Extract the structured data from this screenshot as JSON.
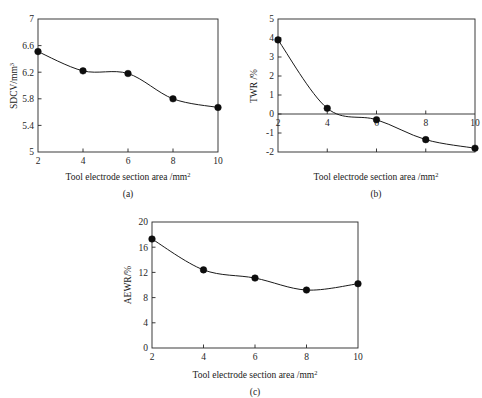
{
  "figure": {
    "xlabel": "Tool electrode section area /mm",
    "xlabel_sup": "2",
    "captions": {
      "a": "(a)",
      "b": "(b)",
      "c": "(c)"
    }
  },
  "chart_data": [
    {
      "type": "line",
      "panel": "(a)",
      "title": "",
      "xlabel": "Tool electrode section area /mm2",
      "ylabel": "SDCV/mm3",
      "ylabel_base": "SDCV/mm",
      "ylabel_sup": "3",
      "x": [
        2,
        4,
        6,
        8,
        10
      ],
      "values": [
        6.51,
        6.22,
        6.18,
        5.8,
        5.67
      ],
      "xlim": [
        2,
        10
      ],
      "ylim": [
        5,
        7
      ],
      "xticks": [
        2,
        4,
        6,
        8,
        10
      ],
      "xticklabels": [
        "2",
        "4",
        "6",
        "8",
        "10"
      ],
      "yticks": [
        5,
        5.4,
        5.8,
        6.2,
        6.6,
        7
      ],
      "yticklabels": [
        "5",
        "5.4",
        "5.8",
        "6.2",
        "6.6",
        "7"
      ],
      "grid": false,
      "legend": "none",
      "marker": "filled-circle",
      "line_style": "smooth"
    },
    {
      "type": "line",
      "panel": "(b)",
      "title": "",
      "xlabel": "Tool electrode section area /mm2",
      "ylabel": "TWR /%",
      "ylabel_base": "TWR /%",
      "ylabel_sup": "",
      "x": [
        2,
        4,
        6,
        8,
        10
      ],
      "values": [
        3.9,
        0.3,
        -0.3,
        -1.35,
        -1.8
      ],
      "xlim": [
        2,
        10
      ],
      "ylim": [
        -2,
        5
      ],
      "xticks": [
        2,
        4,
        6,
        8,
        10
      ],
      "xticklabels": [
        "2",
        "4",
        "6",
        "8",
        "10"
      ],
      "yticks": [
        -2,
        -1,
        0,
        1,
        2,
        3,
        4,
        5
      ],
      "yticklabels": [
        "-2",
        "-1",
        "0",
        "1",
        "2",
        "3",
        "4",
        "5"
      ],
      "zero_line": 0,
      "grid": false,
      "legend": "none",
      "marker": "filled-circle",
      "line_style": "smooth"
    },
    {
      "type": "line",
      "panel": "(c)",
      "title": "",
      "xlabel": "Tool electrode section area /mm2",
      "ylabel": "AEWR/%",
      "ylabel_base": "AEWR/%",
      "ylabel_sup": "",
      "x": [
        2,
        4,
        6,
        8,
        10
      ],
      "values": [
        17.3,
        12.4,
        11.1,
        9.2,
        10.2
      ],
      "xlim": [
        2,
        10
      ],
      "ylim": [
        0,
        20
      ],
      "xticks": [
        2,
        4,
        6,
        8,
        10
      ],
      "xticklabels": [
        "2",
        "4",
        "6",
        "8",
        "10"
      ],
      "yticks": [
        0,
        4,
        8,
        12,
        16,
        20
      ],
      "yticklabels": [
        "0",
        "4",
        "8",
        "12",
        "16",
        "20"
      ],
      "grid": false,
      "legend": "none",
      "marker": "filled-circle",
      "line_style": "smooth"
    }
  ]
}
